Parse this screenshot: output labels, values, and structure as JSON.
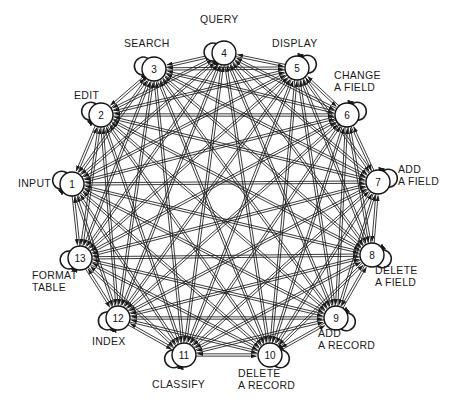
{
  "figure": {
    "title": "",
    "type": "directed-graph",
    "background_color": "#ffffff",
    "line_color": "#1a1a1a",
    "node_fill": "#ffffff",
    "node_stroke": "#111111",
    "text_color": "#1a1a1a"
  },
  "graph": {
    "node_count": 13,
    "node_radius": 12,
    "self_loop_radius": 9,
    "layout": "circular",
    "center": {
      "x": 224,
      "y": 212
    },
    "circle_radius": 159,
    "edges_description": "complete-graph-bidirectional",
    "nodes": [
      {
        "id": "1",
        "number": "1",
        "label": "INPUT",
        "x": 72,
        "y": 184,
        "label_x": 18,
        "label_y": 178,
        "label_align": "left",
        "loop_angle": 200
      },
      {
        "id": "2",
        "number": "2",
        "label": "EDIT",
        "x": 101,
        "y": 115,
        "label_x": 74,
        "label_y": 90,
        "label_align": "left",
        "loop_angle": 200
      },
      {
        "id": "3",
        "number": "3",
        "label": "SEARCH",
        "x": 154,
        "y": 69,
        "label_x": 124,
        "label_y": 38,
        "label_align": "left",
        "loop_angle": 195
      },
      {
        "id": "4",
        "number": "4",
        "label": "QUERY",
        "x": 224,
        "y": 53,
        "label_x": 200,
        "label_y": 14,
        "label_align": "left",
        "loop_angle": 185
      },
      {
        "id": "5",
        "number": "5",
        "label": "DISPLAY",
        "x": 297,
        "y": 68,
        "label_x": 272,
        "label_y": 38,
        "label_align": "left",
        "loop_angle": 340
      },
      {
        "id": "6",
        "number": "6",
        "label": "CHANGE\nA FIELD",
        "x": 347,
        "y": 115,
        "label_x": 334,
        "label_y": 70,
        "label_align": "left",
        "loop_angle": 340
      },
      {
        "id": "7",
        "number": "7",
        "label": "ADD\nA FIELD",
        "x": 378,
        "y": 182,
        "label_x": 398,
        "label_y": 164,
        "label_align": "left",
        "loop_angle": 340
      },
      {
        "id": "8",
        "number": "8",
        "label": "DELETE\nA FIELD",
        "x": 372,
        "y": 255,
        "label_x": 375,
        "label_y": 265,
        "label_align": "left",
        "loop_angle": 20
      },
      {
        "id": "9",
        "number": "9",
        "label": "ADD\nA RECORD",
        "x": 336,
        "y": 318,
        "label_x": 318,
        "label_y": 328,
        "label_align": "left",
        "loop_angle": 20
      },
      {
        "id": "10",
        "number": "10",
        "label": "DELETE\nA RECORD",
        "x": 270,
        "y": 355,
        "label_x": 238,
        "label_y": 368,
        "label_align": "left",
        "loop_angle": 20
      },
      {
        "id": "11",
        "number": "11",
        "label": "CLASSIFY",
        "x": 184,
        "y": 355,
        "label_x": 152,
        "label_y": 379,
        "label_align": "left",
        "loop_angle": 160
      },
      {
        "id": "12",
        "number": "12",
        "label": "INDEX",
        "x": 118,
        "y": 318,
        "label_x": 92,
        "label_y": 336,
        "label_align": "left",
        "loop_angle": 165
      },
      {
        "id": "13",
        "number": "13",
        "label": "FORMAT\nTABLE",
        "x": 80,
        "y": 258,
        "label_x": 32,
        "label_y": 270,
        "label_align": "left",
        "loop_angle": 170
      }
    ]
  }
}
